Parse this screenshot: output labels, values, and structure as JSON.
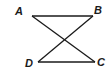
{
  "diagram": {
    "type": "geometry",
    "line_color": "#1a1a1a",
    "points": {
      "A": {
        "label": "A",
        "x": 32,
        "y": 16
      },
      "B": {
        "label": "B",
        "x": 93,
        "y": 16
      },
      "C": {
        "label": "C",
        "x": 95,
        "y": 62
      },
      "D": {
        "label": "D",
        "x": 38,
        "y": 62
      }
    },
    "segments": [
      {
        "from": "A",
        "to": "B"
      },
      {
        "from": "D",
        "to": "C"
      },
      {
        "from": "A",
        "to": "C"
      },
      {
        "from": "B",
        "to": "D"
      }
    ],
    "labels": {
      "A": "A",
      "B": "B",
      "C": "C",
      "D": "D"
    }
  }
}
